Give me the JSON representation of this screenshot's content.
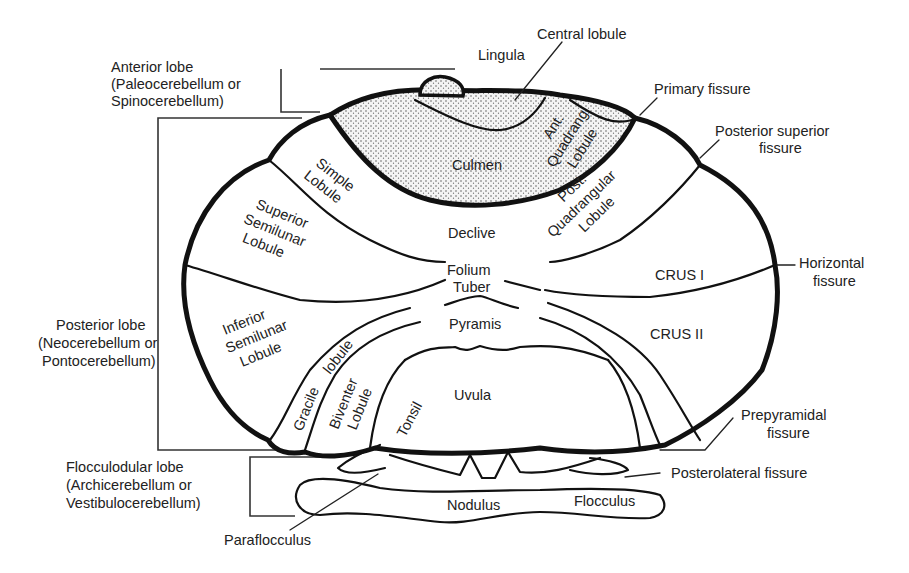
{
  "diagram": {
    "colors": {
      "line": "#111111",
      "text": "#222222",
      "background": "#ffffff",
      "stipple": "#555555"
    }
  },
  "lobe_labels": {
    "anterior": {
      "line1": "Anterior lobe",
      "line2": "(Paleocerebellum or",
      "line3": "Spinocerebellum)"
    },
    "posterior": {
      "line1": "Posterior lobe",
      "line2": "(Neocerebellum or",
      "line3": "Pontocerebellum)"
    },
    "flocculonodular": {
      "line1": "Flocculodular lobe",
      "line2": "(Archicerebellum or",
      "line3": "Vestibulocerebellum)"
    }
  },
  "vermis_labels": {
    "lingula": "Lingula",
    "central_lobule": "Central lobule",
    "culmen": "Culmen",
    "declive": "Declive",
    "folium": "Folium",
    "tuber": "Tuber",
    "pyramis": "Pyramis",
    "uvula": "Uvula",
    "nodulus": "Nodulus"
  },
  "hemisphere_labels": {
    "ant_quadrang": {
      "line1": "Ant.",
      "line2": "Quadrang",
      "line3": "Lobule"
    },
    "post_quadrangular": {
      "line1": "Post.",
      "line2": "Quadrangular",
      "line3": "Lobule"
    },
    "simple": {
      "line1": "Simple",
      "line2": "Lobule"
    },
    "superior_semilunar": {
      "line1": "Superior",
      "line2": "Semilunar",
      "line3": "Lobule"
    },
    "inferior_semilunar": {
      "line1": "Inferior",
      "line2": "Semilunar",
      "line3": "Lobule"
    },
    "crus1": "CRUS I",
    "crus2": "CRUS II",
    "gracile": "Gracile",
    "gracile_lobule": "lobule",
    "biventer": {
      "line1": "Biventer",
      "line2": "Lobule"
    },
    "tonsil": "Tonsil",
    "flocculus": "Flocculus",
    "paraflocculus": "Paraflocculus"
  },
  "fissure_labels": {
    "primary": "Primary fissure",
    "posterior_superior": {
      "line1": "Posterior superior",
      "line2": "fissure"
    },
    "horizontal": {
      "line1": "Horizontal",
      "line2": "fissure"
    },
    "prepyramidal": {
      "line1": "Prepyramidal",
      "line2": "fissure"
    },
    "posterolateral": "Posterolateral fissure"
  }
}
